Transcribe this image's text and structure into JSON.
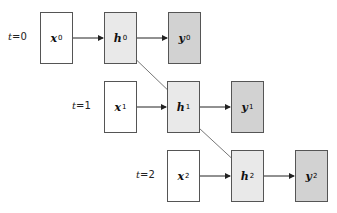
{
  "diagram": {
    "type": "unrolled-rnn",
    "rows": [
      {
        "time_label_var": "t",
        "time_label_eq": "=0",
        "input": {
          "symbol": "x",
          "sub": "0"
        },
        "hidden": {
          "symbol": "h",
          "sub": "0"
        },
        "output": {
          "symbol": "y",
          "sub": "0"
        }
      },
      {
        "time_label_var": "t",
        "time_label_eq": "=1",
        "input": {
          "symbol": "x",
          "sub": "1"
        },
        "hidden": {
          "symbol": "h",
          "sub": "1"
        },
        "output": {
          "symbol": "y",
          "sub": "1"
        }
      },
      {
        "time_label_var": "t",
        "time_label_eq": "=2",
        "input": {
          "symbol": "x",
          "sub": "2"
        },
        "hidden": {
          "symbol": "h",
          "sub": "2"
        },
        "output": {
          "symbol": "y",
          "sub": "2"
        }
      }
    ],
    "colors": {
      "input_fill": "#ffffff",
      "hidden_fill": "#e9e9e9",
      "output_fill": "#d2d2d2",
      "border": "#555555",
      "arrow": "#222222",
      "recurrent_arrow": "#777777"
    }
  }
}
